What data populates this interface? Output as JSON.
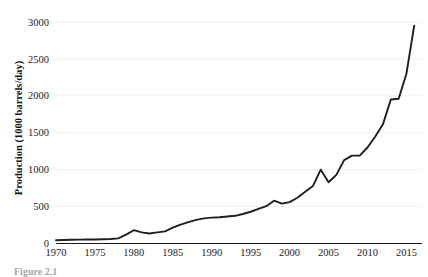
{
  "figure": {
    "caption": "Figure 2.1"
  },
  "chart_data": {
    "type": "line",
    "title": "",
    "xlabel": "",
    "ylabel": "Production (1000 barrels/day)",
    "xlim": [
      1970,
      2017
    ],
    "ylim": [
      0,
      3000
    ],
    "grid": "horizontal",
    "legend": "none",
    "line_color": "#1f1f1f",
    "xticks": [
      1970,
      1975,
      1980,
      1985,
      1990,
      1995,
      2000,
      2005,
      2010,
      2015
    ],
    "yticks": [
      0,
      500,
      1000,
      1500,
      2000,
      2500,
      3000
    ],
    "x": [
      1970,
      1971,
      1972,
      1973,
      1974,
      1975,
      1976,
      1977,
      1978,
      1979,
      1980,
      1981,
      1982,
      1983,
      1984,
      1985,
      1986,
      1987,
      1988,
      1989,
      1990,
      1991,
      1992,
      1993,
      1994,
      1995,
      1996,
      1997,
      1998,
      1999,
      2000,
      2001,
      2002,
      2003,
      2004,
      2005,
      2006,
      2007,
      2008,
      2009,
      2010,
      2011,
      2012,
      2013,
      2014,
      2015,
      2016
    ],
    "values": [
      45,
      48,
      50,
      52,
      55,
      55,
      58,
      60,
      70,
      120,
      180,
      150,
      135,
      150,
      165,
      215,
      255,
      290,
      320,
      340,
      350,
      355,
      365,
      375,
      400,
      430,
      470,
      505,
      580,
      540,
      560,
      620,
      700,
      780,
      1000,
      830,
      930,
      1130,
      1190,
      1190,
      1300,
      1450,
      1620,
      1950,
      1960,
      2300,
      2950
    ],
    "series_name": "Production"
  }
}
